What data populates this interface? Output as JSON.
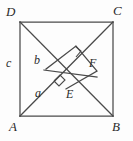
{
  "figure": {
    "shape": "square",
    "stroke_color": "#4a4a4a",
    "label_color": "#2b2b2b",
    "background_color": "#fdfdfd",
    "vertices": [
      {
        "name": "D",
        "label": "D",
        "x": 20,
        "y": 22,
        "label_x": 7,
        "label_y": 6
      },
      {
        "name": "C",
        "label": "C",
        "x": 113,
        "y": 22,
        "label_x": 114,
        "label_y": 5
      },
      {
        "name": "A",
        "label": "A",
        "x": 20,
        "y": 116,
        "label_x": 10,
        "label_y": 121
      },
      {
        "name": "B",
        "label": "B",
        "x": 113,
        "y": 116,
        "label_x": 112,
        "label_y": 121
      }
    ],
    "interior_points": [
      {
        "name": "E",
        "label": "E",
        "x": 63,
        "y": 88,
        "label_x": 66,
        "label_y": 91
      },
      {
        "name": "F",
        "label": "F",
        "x": 89,
        "y": 69,
        "label_x": 89,
        "label_y": 59
      }
    ],
    "segment_labels": [
      {
        "name": "c",
        "label": "c",
        "x": 7,
        "y": 62,
        "note": "left side AD"
      },
      {
        "name": "b",
        "label": "b",
        "x": 35,
        "y": 58,
        "note": "segment near D-E"
      },
      {
        "name": "a",
        "label": "a",
        "x": 36,
        "y": 90,
        "note": "segment along diagonal A-E"
      }
    ],
    "right_angle_marks": [
      {
        "name": "right-angle-at-E",
        "x": 57,
        "y": 82
      },
      {
        "name": "right-angle-at-F",
        "x": 78,
        "y": 55
      }
    ],
    "edges": [
      {
        "name": "side-DC",
        "from": "D",
        "to": "C"
      },
      {
        "name": "side-CB",
        "from": "C",
        "to": "B"
      },
      {
        "name": "side-BA",
        "from": "B",
        "to": "A"
      },
      {
        "name": "side-AD",
        "from": "A",
        "to": "D"
      },
      {
        "name": "diagonal-AC",
        "from": "A",
        "to": "C"
      },
      {
        "name": "segment-DE",
        "from": "D",
        "to": "E"
      },
      {
        "name": "segment-EB",
        "from": "E",
        "to": "B"
      },
      {
        "name": "segment-GF",
        "from": "G",
        "to": "F"
      }
    ]
  }
}
